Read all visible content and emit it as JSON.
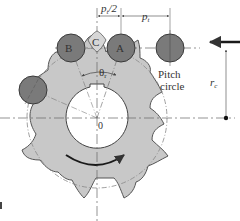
{
  "diagram": {
    "colors": {
      "sprocket_fill": "#c8c8c8",
      "sprocket_stroke": "#555555",
      "roller_fill": "#7a7a7a",
      "roller_stroke": "#3a3a3a",
      "line": "#666666",
      "arrow": "#1a1a1a",
      "text": "#333333"
    },
    "labels": {
      "roller_b": "B",
      "roller_c": "C",
      "roller_a": "A",
      "center": "0",
      "half_pitch_p": "p",
      "half_pitch_sub": "t",
      "half_pitch_suffix": "/2",
      "pitch_p": "p",
      "pitch_sub": "t",
      "angle_theta": "θ",
      "angle_sub": "r",
      "pitch_circle_line1": "Pitch",
      "pitch_circle_line2": "circle",
      "radius_r": "r",
      "radius_sub": "c"
    }
  }
}
